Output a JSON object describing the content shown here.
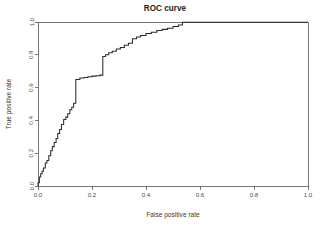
{
  "chart_data": {
    "type": "line",
    "title": "ROC curve",
    "xlabel": "False positive rate",
    "ylabel": "True positive rate",
    "xlim": [
      0.0,
      1.0
    ],
    "ylim": [
      0.0,
      1.0
    ],
    "xticks": [
      "0.0",
      "0.2",
      "0.4",
      "0.6",
      "0.8",
      "1.0"
    ],
    "xtick_values": [
      0.0,
      0.2,
      0.4,
      0.6,
      0.8,
      1.0
    ],
    "yticks": [
      "0.0",
      "0.2",
      "0.4",
      "0.6",
      "0.8",
      "1.0"
    ],
    "ytick_values": [
      0.0,
      0.2,
      0.4,
      0.6,
      0.8,
      1.0
    ],
    "grid": false,
    "legend": null,
    "series": [
      {
        "name": "ROC",
        "step": "post",
        "color": "#2b2b2b",
        "x": [
          0.0,
          0.0,
          0.005,
          0.005,
          0.01,
          0.01,
          0.015,
          0.015,
          0.02,
          0.02,
          0.027,
          0.027,
          0.033,
          0.033,
          0.04,
          0.04,
          0.047,
          0.047,
          0.053,
          0.053,
          0.06,
          0.06,
          0.067,
          0.067,
          0.073,
          0.073,
          0.08,
          0.08,
          0.087,
          0.087,
          0.095,
          0.095,
          0.103,
          0.103,
          0.11,
          0.11,
          0.118,
          0.118,
          0.125,
          0.125,
          0.132,
          0.132,
          0.14,
          0.14,
          0.155,
          0.155,
          0.17,
          0.17,
          0.185,
          0.185,
          0.2,
          0.2,
          0.215,
          0.215,
          0.23,
          0.23,
          0.24,
          0.24,
          0.25,
          0.25,
          0.262,
          0.262,
          0.275,
          0.275,
          0.29,
          0.29,
          0.305,
          0.305,
          0.32,
          0.32,
          0.335,
          0.335,
          0.35,
          0.35,
          0.365,
          0.365,
          0.38,
          0.38,
          0.4,
          0.4,
          0.42,
          0.42,
          0.44,
          0.44,
          0.46,
          0.46,
          0.48,
          0.48,
          0.5,
          0.5,
          0.52,
          0.52,
          0.535,
          0.535,
          1.0
        ],
        "y": [
          0.0,
          0.02,
          0.02,
          0.055,
          0.055,
          0.075,
          0.075,
          0.09,
          0.09,
          0.11,
          0.11,
          0.14,
          0.14,
          0.155,
          0.155,
          0.185,
          0.185,
          0.215,
          0.215,
          0.24,
          0.24,
          0.265,
          0.265,
          0.29,
          0.29,
          0.32,
          0.32,
          0.345,
          0.345,
          0.375,
          0.375,
          0.405,
          0.405,
          0.42,
          0.42,
          0.44,
          0.44,
          0.465,
          0.465,
          0.48,
          0.48,
          0.505,
          0.505,
          0.65,
          0.65,
          0.658,
          0.658,
          0.662,
          0.662,
          0.666,
          0.666,
          0.67,
          0.67,
          0.672,
          0.672,
          0.676,
          0.676,
          0.79,
          0.79,
          0.8,
          0.8,
          0.812,
          0.812,
          0.822,
          0.822,
          0.835,
          0.835,
          0.845,
          0.845,
          0.858,
          0.858,
          0.87,
          0.87,
          0.898,
          0.898,
          0.908,
          0.908,
          0.918,
          0.918,
          0.93,
          0.93,
          0.938,
          0.938,
          0.948,
          0.948,
          0.955,
          0.955,
          0.962,
          0.962,
          0.972,
          0.972,
          0.982,
          0.982,
          0.998,
          0.998
        ]
      }
    ]
  },
  "axes": {
    "plot_left_px": 38,
    "plot_right_px": 308,
    "plot_top_px": 22,
    "plot_bottom_px": 186
  }
}
